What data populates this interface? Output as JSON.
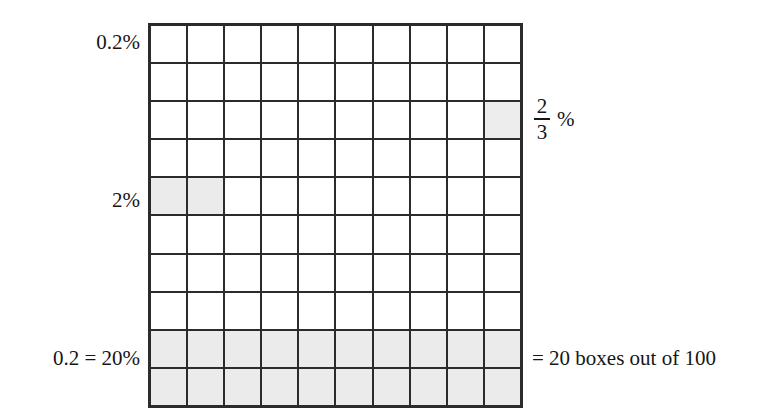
{
  "figure": {
    "grid": {
      "rows": 10,
      "columns": 10,
      "total_boxes": 100,
      "line_color": "#2b2b2b",
      "cell_fill": "#ffffff",
      "shaded_fill": "#ebebeb",
      "shaded_cells": [
        {
          "row": 3,
          "col": 10,
          "type": "partial",
          "meaning": "2/3 %"
        },
        {
          "row": 5,
          "col": 1,
          "type": "full",
          "meaning": "2%"
        },
        {
          "row": 5,
          "col": 2,
          "type": "full",
          "meaning": "2%"
        },
        {
          "row": 9,
          "col": 1,
          "type": "full"
        },
        {
          "row": 9,
          "col": 2,
          "type": "full"
        },
        {
          "row": 9,
          "col": 3,
          "type": "full"
        },
        {
          "row": 9,
          "col": 4,
          "type": "full"
        },
        {
          "row": 9,
          "col": 5,
          "type": "full"
        },
        {
          "row": 9,
          "col": 6,
          "type": "full"
        },
        {
          "row": 9,
          "col": 7,
          "type": "full"
        },
        {
          "row": 9,
          "col": 8,
          "type": "full"
        },
        {
          "row": 9,
          "col": 9,
          "type": "full"
        },
        {
          "row": 9,
          "col": 10,
          "type": "full"
        },
        {
          "row": 10,
          "col": 1,
          "type": "full"
        },
        {
          "row": 10,
          "col": 2,
          "type": "full"
        },
        {
          "row": 10,
          "col": 3,
          "type": "full"
        },
        {
          "row": 10,
          "col": 4,
          "type": "full"
        },
        {
          "row": 10,
          "col": 5,
          "type": "full"
        },
        {
          "row": 10,
          "col": 6,
          "type": "full"
        },
        {
          "row": 10,
          "col": 7,
          "type": "full"
        },
        {
          "row": 10,
          "col": 8,
          "type": "full"
        },
        {
          "row": 10,
          "col": 9,
          "type": "full"
        },
        {
          "row": 10,
          "col": 10,
          "type": "full"
        }
      ]
    },
    "labels": {
      "top_left": "0.2%",
      "mid_left": "2%",
      "bottom_left": "0.2 = 20%",
      "bottom_right": "= 20 boxes out of 100",
      "fraction": {
        "numerator": "2",
        "denominator": "3",
        "percent_sign": "%"
      }
    }
  },
  "chart_data": {
    "type": "heatmap",
    "xlabel": "",
    "ylabel": "",
    "categories": [
      "1",
      "2",
      "3",
      "4",
      "5",
      "6",
      "7",
      "8",
      "9",
      "10"
    ],
    "rows": [
      "1",
      "2",
      "3",
      "4",
      "5",
      "6",
      "7",
      "8",
      "9",
      "10"
    ],
    "values": [
      [
        0,
        0,
        0,
        0,
        0,
        0,
        0,
        0,
        0,
        0
      ],
      [
        0,
        0,
        0,
        0,
        0,
        0,
        0,
        0,
        0,
        0
      ],
      [
        0,
        0,
        0,
        0,
        0,
        0,
        0,
        0,
        0,
        1
      ],
      [
        0,
        0,
        0,
        0,
        0,
        0,
        0,
        0,
        0,
        0
      ],
      [
        1,
        1,
        0,
        0,
        0,
        0,
        0,
        0,
        0,
        0
      ],
      [
        0,
        0,
        0,
        0,
        0,
        0,
        0,
        0,
        0,
        0
      ],
      [
        0,
        0,
        0,
        0,
        0,
        0,
        0,
        0,
        0,
        0
      ],
      [
        0,
        0,
        0,
        0,
        0,
        0,
        0,
        0,
        0,
        0
      ],
      [
        1,
        1,
        1,
        1,
        1,
        1,
        1,
        1,
        1,
        1
      ],
      [
        1,
        1,
        1,
        1,
        1,
        1,
        1,
        1,
        1,
        1
      ]
    ],
    "annotations": [
      {
        "text": "0.2%",
        "position": "left of row 1",
        "shaded_boxes": 0
      },
      {
        "text": "2/3 %",
        "position": "right of row 3",
        "shaded_boxes": 1
      },
      {
        "text": "2%",
        "position": "left of row 5",
        "shaded_boxes": 2
      },
      {
        "text": "0.2 = 20%",
        "position": "left of rows 9-10",
        "shaded_boxes": 20
      },
      {
        "text": "= 20 boxes out of 100",
        "position": "right of rows 9-10",
        "shaded_boxes": 20
      }
    ],
    "grid": true,
    "legend": "none"
  }
}
